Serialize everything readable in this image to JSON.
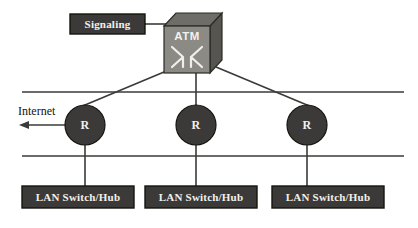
{
  "diagram": {
    "background_color": "#ffffff",
    "line_color": "#3a3a38",
    "box_fill": "#3b3a38",
    "box_border": "#15140f",
    "box_text_color": "#f2f1ee",
    "router_fill": "#3b3a38",
    "cube_front": "#8b8a84",
    "cube_top": "#6e6d67",
    "cube_side": "#56554f",
    "cube_edge": "#2b2a26"
  },
  "nodes": {
    "signaling": {
      "label": "Signaling",
      "x": 70,
      "y": 14,
      "width": 75,
      "height": 20
    },
    "atm_switch": {
      "label": "ATM",
      "symbol": "cross-connect-x",
      "x": 164,
      "y": 13,
      "width": 58,
      "height": 60
    },
    "routers": [
      {
        "label": "R",
        "cx": 85,
        "cy": 125,
        "r": 20
      },
      {
        "label": "R",
        "cx": 196,
        "cy": 125,
        "r": 20
      },
      {
        "label": "R",
        "cx": 307,
        "cy": 125,
        "r": 20
      }
    ],
    "lan_switches": [
      {
        "label": "LAN Switch/Hub",
        "x": 22,
        "y": 186,
        "width": 112,
        "height": 22
      },
      {
        "label": "LAN Switch/Hub",
        "x": 145,
        "y": 186,
        "width": 112,
        "height": 22
      },
      {
        "label": "LAN Switch/Hub",
        "x": 272,
        "y": 186,
        "width": 112,
        "height": 22
      }
    ]
  },
  "annotations": {
    "internet": {
      "label": "Internet",
      "x": 18,
      "y": 104,
      "arrow_direction": "left"
    }
  },
  "bus_lines": [
    {
      "name": "upper-bus",
      "x1": 22,
      "y1": 92,
      "x2": 404,
      "y2": 92
    },
    {
      "name": "lower-bus",
      "x1": 22,
      "y1": 156,
      "x2": 404,
      "y2": 156
    }
  ]
}
